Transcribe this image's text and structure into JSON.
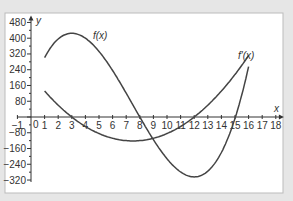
{
  "chart_data": {
    "type": "line",
    "title": "",
    "xlabel": "x",
    "ylabel": "y",
    "xlim": [
      -1,
      18
    ],
    "ylim": [
      -320,
      480
    ],
    "x_ticks": [
      -1,
      0,
      1,
      2,
      3,
      4,
      5,
      6,
      7,
      8,
      9,
      10,
      11,
      12,
      13,
      14,
      15,
      16,
      17,
      18
    ],
    "y_ticks": [
      480,
      400,
      320,
      240,
      160,
      80,
      -80,
      -160,
      -240,
      -320
    ],
    "grid": false,
    "series": [
      {
        "name": "f(x)",
        "x": [
          1,
          2,
          3,
          4,
          5,
          6,
          7,
          8,
          9,
          10,
          11,
          12,
          13,
          14,
          15,
          16
        ],
        "values": [
          301,
          405,
          425,
          384,
          303,
          200,
          97,
          0,
          -70,
          -126,
          -212,
          -304,
          -282,
          -182,
          -7,
          256
        ],
        "label": "f(x)"
      },
      {
        "name": "f'(x)",
        "x": [
          1,
          2,
          3,
          4,
          5,
          6,
          7,
          8,
          9,
          10,
          11,
          12,
          13,
          14,
          15,
          16
        ],
        "values": [
          132,
          60,
          0,
          -48,
          -84,
          -108,
          -120,
          -120,
          -108,
          -84,
          -48,
          0,
          60,
          132,
          216,
          312
        ],
        "label": "f'(x)"
      }
    ],
    "annotations": [
      "f(x)",
      "f'(x)"
    ]
  },
  "labels": {
    "x_axis": "x",
    "y_axis": "y",
    "f": "f(x)",
    "fprime": "f'(x)",
    "origin": "0"
  }
}
